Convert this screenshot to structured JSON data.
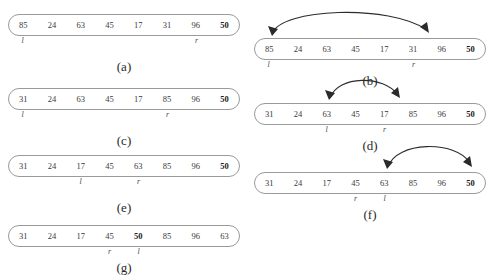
{
  "figure": {
    "cell_count": 8,
    "colors": {
      "capsule_border": "#9a9a9a",
      "cell_text": "#3a3a3a",
      "pivot_text": "#1a1a1a",
      "arc_stroke": "#2b2b2b"
    },
    "pointer_labels": {
      "left": "l",
      "right": "r"
    }
  },
  "panels": [
    {
      "caption": "(a)",
      "values": [
        "85",
        "24",
        "63",
        "45",
        "17",
        "31",
        "96",
        "50"
      ],
      "pivot_index": 7,
      "pointers": [
        {
          "label": "l",
          "index": 0
        },
        {
          "label": "r",
          "index": 6
        }
      ],
      "arc": null
    },
    {
      "caption": "(b)",
      "values": [
        "85",
        "24",
        "63",
        "45",
        "17",
        "31",
        "96",
        "50"
      ],
      "pivot_index": 7,
      "pointers": [
        {
          "label": "l",
          "index": 0
        },
        {
          "label": "r",
          "index": 5
        }
      ],
      "arc": {
        "from_index": 0,
        "to_index": 5,
        "kind": "swap"
      }
    },
    {
      "caption": "(c)",
      "values": [
        "31",
        "24",
        "63",
        "45",
        "17",
        "85",
        "96",
        "50"
      ],
      "pivot_index": 7,
      "pointers": [
        {
          "label": "l",
          "index": 0
        },
        {
          "label": "r",
          "index": 5
        }
      ],
      "arc": null
    },
    {
      "caption": "(d)",
      "values": [
        "31",
        "24",
        "63",
        "45",
        "17",
        "85",
        "96",
        "50"
      ],
      "pivot_index": 7,
      "pointers": [
        {
          "label": "l",
          "index": 2
        },
        {
          "label": "r",
          "index": 4
        }
      ],
      "arc": {
        "from_index": 2,
        "to_index": 4,
        "kind": "swap"
      }
    },
    {
      "caption": "(e)",
      "values": [
        "31",
        "24",
        "17",
        "45",
        "63",
        "85",
        "96",
        "50"
      ],
      "pivot_index": 7,
      "pointers": [
        {
          "label": "l",
          "index": 2
        },
        {
          "label": "r",
          "index": 4
        }
      ],
      "arc": null
    },
    {
      "caption": "(f)",
      "values": [
        "31",
        "24",
        "17",
        "45",
        "63",
        "85",
        "96",
        "50"
      ],
      "pivot_index": 7,
      "pointers": [
        {
          "label": "r",
          "index": 3
        },
        {
          "label": "l",
          "index": 4
        }
      ],
      "arc": {
        "from_index": 4,
        "to_index": 7,
        "kind": "swap"
      }
    },
    {
      "caption": "(g)",
      "values": [
        "31",
        "24",
        "17",
        "45",
        "50",
        "85",
        "96",
        "63"
      ],
      "pivot_index": 4,
      "pointers": [
        {
          "label": "r",
          "index": 3
        },
        {
          "label": "l",
          "index": 4
        }
      ],
      "arc": null
    }
  ]
}
